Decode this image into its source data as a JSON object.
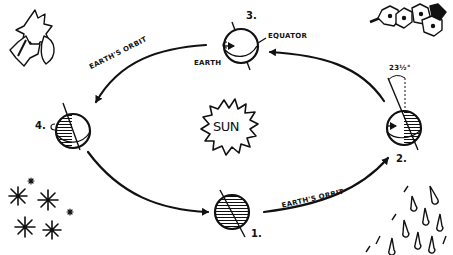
{
  "diagram": {
    "title": "",
    "center": {
      "label": "SUN"
    },
    "orbit_labels": {
      "upper_left": "EARTH'S ORBIT",
      "lower_right": "EARTH'S ORBIT"
    },
    "positions": [
      {
        "number": "1.",
        "season_icon": "snowflakes",
        "shading": "mostly-dark"
      },
      {
        "number": "2.",
        "season_icon": "rain",
        "shading": "right-half-dark",
        "annotation": "23½°"
      },
      {
        "number": "3.",
        "season_icon": "flowers",
        "shading": "light",
        "annotations": [
          "EARTH",
          "EQUATOR"
        ]
      },
      {
        "number": "4.",
        "season_icon": "leaves",
        "shading": "left-half-dark"
      }
    ],
    "labels": {
      "earth": "EARTH",
      "equator": "EQUATOR",
      "tilt": "23½°"
    },
    "colors": {
      "ink": "#111111",
      "background": "#ffffff"
    }
  }
}
